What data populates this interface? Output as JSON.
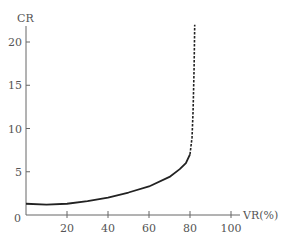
{
  "chart_data": {
    "type": "line",
    "title": "",
    "xlabel": "VR(%)",
    "ylabel": "CR",
    "xlim": [
      0,
      100
    ],
    "ylim": [
      0,
      22
    ],
    "x_ticks": [
      20,
      40,
      60,
      80,
      100
    ],
    "y_ticks": [
      5,
      10,
      15,
      20
    ],
    "origin_label": "0",
    "grid": false,
    "series": [
      {
        "name": "CR (solid)",
        "style": "solid",
        "x": [
          0,
          10,
          20,
          30,
          40,
          50,
          60,
          70,
          75,
          78,
          80
        ],
        "y": [
          1.3,
          1.2,
          1.3,
          1.6,
          2.0,
          2.6,
          3.3,
          4.4,
          5.3,
          6.0,
          7.0
        ]
      },
      {
        "name": "CR (extrapolated, dashed)",
        "style": "dashed",
        "x": [
          80,
          81,
          81.5,
          82,
          82.3
        ],
        "y": [
          7.0,
          9.0,
          12.0,
          17.0,
          22.0
        ]
      }
    ]
  }
}
